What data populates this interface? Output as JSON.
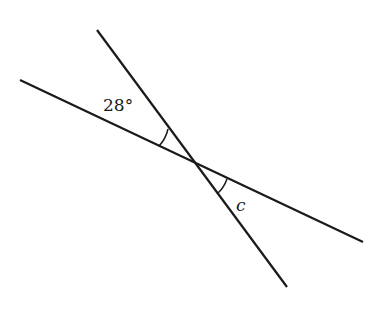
{
  "diagram": {
    "lines": [
      {
        "name": "line-1",
        "x1": 20,
        "y1": 80,
        "x2": 363,
        "y2": 242
      },
      {
        "name": "line-2",
        "x1": 97,
        "y1": 30,
        "x2": 287,
        "y2": 287
      }
    ],
    "intersection": {
      "x": 193,
      "y": 162
    },
    "angles": [
      {
        "name": "given-angle",
        "label": "28°",
        "label_x": 103,
        "label_y": 111
      },
      {
        "name": "unknown-angle",
        "label": "c",
        "label_x": 236,
        "label_y": 211
      }
    ],
    "colors": {
      "stroke": "#1a1a1a",
      "background": "#ffffff"
    }
  }
}
